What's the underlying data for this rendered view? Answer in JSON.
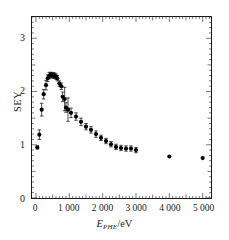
{
  "figure": {
    "background_color": "#ffffff",
    "frame_color": "#1a1a1a",
    "marker_color": "#000000"
  },
  "axes": {
    "y": {
      "title": "SEY",
      "tick_labels": [
        "0",
        "1",
        "2",
        "3"
      ],
      "tick_values": [
        0,
        1,
        2,
        3
      ],
      "limits": [
        0,
        3.4
      ],
      "minor_tick_step": 0.1
    },
    "x": {
      "title_main": "E",
      "title_sub": "PHE",
      "title_unit": "/eV",
      "tick_labels": [
        "0",
        "1 000",
        "2 000",
        "3 000",
        "4 000",
        "5 000"
      ],
      "tick_values": [
        0,
        1000,
        2000,
        3000,
        4000,
        5000
      ],
      "limits": [
        -120,
        5250
      ],
      "minor_tick_step": 100
    }
  },
  "chart_data": {
    "type": "scatter",
    "title": "",
    "xlabel": "E_PHE/eV",
    "ylabel": "SEY",
    "xlim": [
      -120,
      5250
    ],
    "ylim": [
      0,
      3.4
    ],
    "grid": false,
    "legend": null,
    "marker": "filled-circle",
    "error_bars": "vertical",
    "series": [
      {
        "name": "SEY measurement",
        "x": [
          40,
          100,
          170,
          230,
          300,
          350,
          400,
          440,
          480,
          520,
          560,
          600,
          640,
          700,
          760,
          800,
          860,
          900,
          960,
          1050,
          1200,
          1350,
          1500,
          1650,
          1800,
          1950,
          2100,
          2250,
          2400,
          2550,
          2700,
          2850,
          3000,
          4000,
          5000
        ],
        "y": [
          0.95,
          1.19,
          1.66,
          1.95,
          2.12,
          2.25,
          2.3,
          2.31,
          2.31,
          2.3,
          2.3,
          2.28,
          2.25,
          2.15,
          2.1,
          1.9,
          1.86,
          1.7,
          1.66,
          1.6,
          1.53,
          1.43,
          1.34,
          1.28,
          1.2,
          1.13,
          1.07,
          1.01,
          0.96,
          0.94,
          0.93,
          0.93,
          0.9,
          0.78,
          0.75
        ],
        "yerr": [
          0.03,
          0.09,
          0.12,
          0.09,
          0.09,
          0.06,
          0.06,
          0.05,
          0.05,
          0.05,
          0.05,
          0.05,
          0.05,
          0.05,
          0.06,
          0.09,
          0.22,
          0.09,
          0.22,
          0.09,
          0.07,
          0.07,
          0.06,
          0.06,
          0.06,
          0.05,
          0.05,
          0.05,
          0.05,
          0.05,
          0.05,
          0.05,
          0.05,
          0.0,
          0.0
        ]
      }
    ]
  }
}
